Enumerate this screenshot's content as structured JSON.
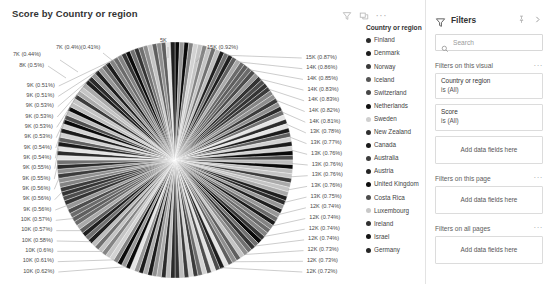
{
  "visual": {
    "title": "Score by Country or region",
    "header_icons": [
      {
        "name": "filter-icon",
        "glyph": "funnel"
      },
      {
        "name": "focus-mode-icon",
        "glyph": "focus"
      },
      {
        "name": "more-options-icon",
        "glyph": "..."
      }
    ]
  },
  "legend": {
    "title": "Country or region",
    "items": [
      {
        "label": "Finland",
        "color": "#2b2b2b"
      },
      {
        "label": "Denmark",
        "color": "#1c1c1c"
      },
      {
        "label": "Norway",
        "color": "#3a3a3a"
      },
      {
        "label": "Iceland",
        "color": "#555555"
      },
      {
        "label": "Switzerland",
        "color": "#464646"
      },
      {
        "label": "Netherlands",
        "color": "#101010"
      },
      {
        "label": "Sweden",
        "color": "#cfcfcf"
      },
      {
        "label": "New Zealand",
        "color": "#2f2f2f"
      },
      {
        "label": "Canada",
        "color": "#1a1a1a"
      },
      {
        "label": "Australia",
        "color": "#3d3d3d"
      },
      {
        "label": "Austria",
        "color": "#232323"
      },
      {
        "label": "United Kingdom",
        "color": "#0d0d0d"
      },
      {
        "label": "Costa Rica",
        "color": "#4d4d4d"
      },
      {
        "label": "Luxembourg",
        "color": "#c8c8c8"
      },
      {
        "label": "Ireland",
        "color": "#303030"
      },
      {
        "label": "Israel",
        "color": "#151515"
      },
      {
        "label": "Germany",
        "color": "#262626"
      }
    ]
  },
  "filters": {
    "title": "Filters",
    "pin_icon": "pin-icon",
    "collapse_icon": "chevron-right-icon",
    "search_placeholder": "Search",
    "search_value": "",
    "sections": [
      {
        "title": "Filters on this visual",
        "cards": [
          {
            "field": "Country or region",
            "state": "is (All)"
          },
          {
            "field": "Score",
            "state": "is (All)"
          }
        ],
        "dropzone": "Add data fields here"
      },
      {
        "title": "Filters on this page",
        "cards": [],
        "dropzone": "Add data fields here"
      },
      {
        "title": "Filters on all pages",
        "cards": [],
        "dropzone": "Add data fields here"
      }
    ]
  },
  "chart_data": {
    "type": "pie",
    "title": "Score by Country or region",
    "legend_title": "Country or region",
    "legend_position": "right",
    "value_label_format": "{value} ({percent})",
    "labels_shown": [
      {
        "value": "15K",
        "percent": "0.92%",
        "side": "top"
      },
      {
        "value": "15K",
        "percent": "0.87%",
        "side": "right"
      },
      {
        "value": "14K",
        "percent": "0.86%",
        "side": "right"
      },
      {
        "value": "14K",
        "percent": "0.85%",
        "side": "right"
      },
      {
        "value": "14K",
        "percent": "0.83%",
        "side": "right"
      },
      {
        "value": "14K",
        "percent": "0.83%",
        "side": "right"
      },
      {
        "value": "14K",
        "percent": "0.82%",
        "side": "right"
      },
      {
        "value": "14K",
        "percent": "0.81%",
        "side": "right"
      },
      {
        "value": "13K",
        "percent": "0.78%",
        "side": "right"
      },
      {
        "value": "13K",
        "percent": "0.77%",
        "side": "right"
      },
      {
        "value": "13K",
        "percent": "0.76%",
        "side": "right"
      },
      {
        "value": "13K",
        "percent": "0.76%",
        "side": "right"
      },
      {
        "value": "13K",
        "percent": "0.76%",
        "side": "right"
      },
      {
        "value": "13K",
        "percent": "0.76%",
        "side": "right"
      },
      {
        "value": "13K",
        "percent": "0.75%",
        "side": "right"
      },
      {
        "value": "12K",
        "percent": "0.74%",
        "side": "right"
      },
      {
        "value": "12K",
        "percent": "0.74%",
        "side": "right"
      },
      {
        "value": "12K",
        "percent": "0.74%",
        "side": "right"
      },
      {
        "value": "12K",
        "percent": "0.74%",
        "side": "right"
      },
      {
        "value": "12K",
        "percent": "0.73%",
        "side": "right"
      },
      {
        "value": "12K",
        "percent": "0.73%",
        "side": "right"
      },
      {
        "value": "12K",
        "percent": "0.72%",
        "side": "right"
      },
      {
        "value": "10K",
        "percent": "0.62%",
        "side": "left"
      },
      {
        "value": "10K",
        "percent": "0.61%",
        "side": "left"
      },
      {
        "value": "10K",
        "percent": "0.6%",
        "side": "left"
      },
      {
        "value": "10K",
        "percent": "0.58%",
        "side": "left"
      },
      {
        "value": "10K",
        "percent": "0.57%",
        "side": "left"
      },
      {
        "value": "10K",
        "percent": "0.57%",
        "side": "left"
      },
      {
        "value": "9K",
        "percent": "0.56%",
        "side": "left"
      },
      {
        "value": "9K",
        "percent": "0.56%",
        "side": "left"
      },
      {
        "value": "9K",
        "percent": "0.55%",
        "side": "left"
      },
      {
        "value": "9K",
        "percent": "0.55%",
        "side": "left"
      },
      {
        "value": "9K",
        "percent": "0.54%",
        "side": "left"
      },
      {
        "value": "9K",
        "percent": "0.54%",
        "side": "left"
      },
      {
        "value": "9K",
        "percent": "0.53%",
        "side": "left"
      },
      {
        "value": "9K",
        "percent": "0.53%",
        "side": "left"
      },
      {
        "value": "9K",
        "percent": "0.53%",
        "side": "left"
      },
      {
        "value": "9K",
        "percent": "0.53%",
        "side": "left"
      },
      {
        "value": "9K",
        "percent": "0.51%",
        "side": "left"
      },
      {
        "value": "8K",
        "percent": "0.5%",
        "side": "left"
      },
      {
        "value": "7K",
        "percent": "0.44%",
        "side": "left"
      },
      {
        "value": "7K",
        "percent": "0.4%",
        "side": "top"
      },
      {
        "value": "",
        "percent": "0.41%",
        "side": "top"
      },
      {
        "value": "5K",
        "percent": "",
        "side": "top"
      }
    ],
    "right_labels": [
      "15K (0.87%)",
      "14K (0.86%)",
      "14K (0.85%)",
      "14K (0.83%)",
      "14K (0.83%)",
      "14K (0.82%)",
      "14K (0.81%)",
      "13K (0.78%)",
      "13K (0.77%)",
      "13K (0.76%)",
      "13K (0.76%)",
      "13K (0.76%)",
      "13K (0.76%)",
      "13K (0.75%)",
      "12K (0.74%)",
      "12K (0.74%)",
      "12K (0.74%)",
      "12K (0.74%)",
      "12K (0.73%)",
      "12K (0.73%)",
      "12K (0.72%)"
    ],
    "left_labels": [
      "9K (0.51%)",
      "9K (0.51%)",
      "9K (0.53%)",
      "9K (0.53%)",
      "9K (0.53%)",
      "9K (0.53%)",
      "9K (0.54%)",
      "9K (0.54%)",
      "9K (0.55%)",
      "9K (0.55%)",
      "9K (0.56%)",
      "9K (0.56%)",
      "9K (0.56%)",
      "10K (0.57%)",
      "10K (0.57%)",
      "10K (0.58%)",
      "10K (0.6%)",
      "10K (0.61%)",
      "10K (0.62%)"
    ],
    "top_labels": [
      "7K (0.44%)",
      "7K (0.4%)(0.41%)",
      "5K",
      "15K (0.92%)"
    ],
    "upper_left_labels": [
      "8K (0.5%)"
    ]
  }
}
